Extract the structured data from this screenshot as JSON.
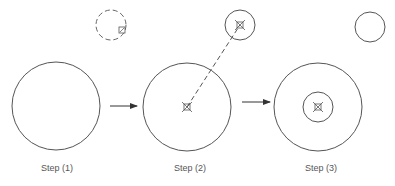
{
  "diagram": {
    "stroke_color": "#555555",
    "steps": [
      {
        "label": "Step (1)",
        "label_x": 17
      },
      {
        "label": "Step (2)",
        "label_x": 150
      },
      {
        "label": "Step (3)",
        "label_x": 281
      }
    ],
    "shapes": {
      "step1_circle": {
        "cx": 56,
        "cy": 106,
        "r": 44
      },
      "step1_dashed_circle": {
        "cx": 111,
        "cy": 25,
        "r": 15
      },
      "step1_grip": {
        "x": 119,
        "y": 27,
        "size": 6
      },
      "arrow1": {
        "x1": 110,
        "y1": 106,
        "x2": 137,
        "y2": 106
      },
      "step2_circle": {
        "cx": 187,
        "cy": 107,
        "r": 44
      },
      "step2_small_circle": {
        "cx": 240,
        "cy": 25,
        "r": 15
      },
      "step2_center_marker": {
        "cx": 187,
        "cy": 107
      },
      "step2_small_marker": {
        "cx": 240,
        "cy": 25
      },
      "step2_dashed_line": {
        "x1": 187,
        "y1": 107,
        "x2": 240,
        "y2": 25
      },
      "arrow2": {
        "x1": 242,
        "y1": 102,
        "x2": 270,
        "y2": 102
      },
      "step3_circle": {
        "cx": 318,
        "cy": 107,
        "r": 44
      },
      "step3_inner_circle": {
        "cx": 318,
        "cy": 107,
        "r": 15
      },
      "step3_center_marker": {
        "cx": 318,
        "cy": 107
      },
      "step3_small_circle": {
        "cx": 370,
        "cy": 27,
        "r": 15
      }
    }
  }
}
